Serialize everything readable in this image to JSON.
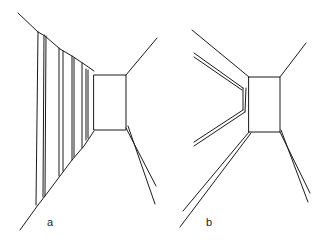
{
  "figure": {
    "panels": [
      {
        "id": "a",
        "label": "a",
        "description": "Corridor in one-point perspective with repeated vertical panels on the left wall and an end wall"
      },
      {
        "id": "b",
        "label": "b",
        "description": "Corridor in perspective with a recessed left wall niche and an end wall"
      }
    ],
    "stroke_color": "#1a1a1a",
    "background_color": "#ffffff"
  }
}
